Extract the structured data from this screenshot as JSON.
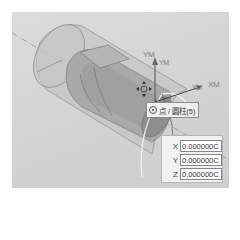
{
  "viewport": {
    "background": "#d4d4d4",
    "model": "cylinder",
    "csys_labels": {
      "ym_outer": "YM",
      "ym_inner": "YM",
      "xm_inner": "XM",
      "xm_outer": "XM"
    }
  },
  "snap_tooltip": {
    "icon": "point-on-curve-icon",
    "text": "点 / 圆柱(5)"
  },
  "coordinate_panel": {
    "rows": [
      {
        "label": "X",
        "value": "0.000000C"
      },
      {
        "label": "Y",
        "value": "0.000000C"
      },
      {
        "label": "Z",
        "value": "0.000000C"
      }
    ]
  }
}
